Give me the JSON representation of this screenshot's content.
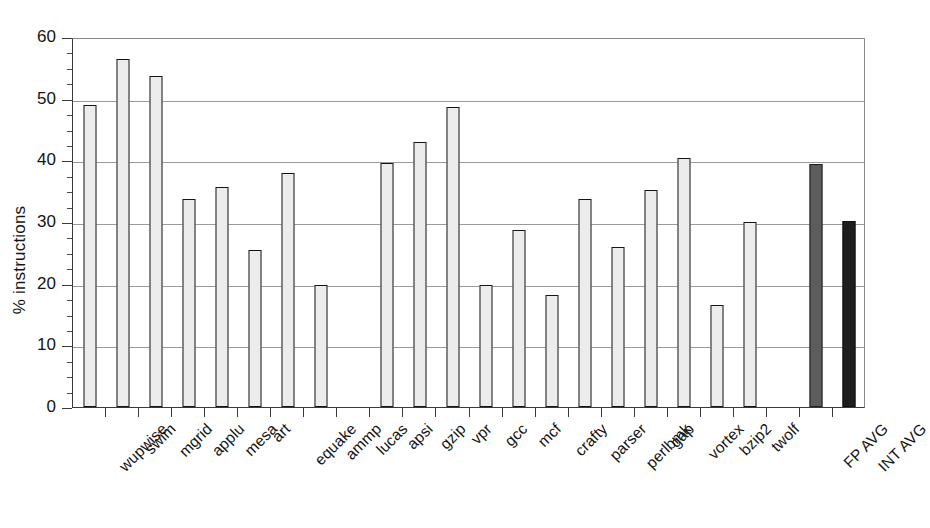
{
  "chart_data": {
    "type": "bar",
    "title": "",
    "xlabel": "",
    "ylabel": "% instructions",
    "ylim": [
      0,
      60
    ],
    "yticks": [
      0,
      10,
      20,
      30,
      40,
      50,
      60
    ],
    "ytick_labels": [
      "0",
      "10",
      "20",
      "30",
      "40",
      "50",
      "60"
    ],
    "minor_tick_step": 2.5,
    "grid": "horizontal",
    "legend": "none",
    "categories": [
      "wupwise",
      "swim",
      "mgrid",
      "applu",
      "mesa",
      "art",
      "equake",
      "ammp",
      "lucas",
      "apsi",
      "gzip",
      "vpr",
      "gcc",
      "mcf",
      "crafty",
      "parser",
      "perlbmk",
      "gap",
      "vortex",
      "bzip2",
      "twolf",
      "",
      "FP AVG",
      "INT AVG"
    ],
    "values": [
      49.0,
      56.4,
      53.6,
      33.7,
      35.6,
      25.4,
      38.0,
      19.8,
      null,
      39.6,
      43.0,
      48.6,
      19.8,
      28.7,
      18.1,
      33.7,
      26.0,
      35.2,
      40.4,
      16.5,
      30.0,
      null,
      39.4,
      30.1
    ],
    "bar_colors": [
      "#ececec",
      "#ececec",
      "#ececec",
      "#ececec",
      "#ececec",
      "#ececec",
      "#ececec",
      "#ececec",
      null,
      "#ececec",
      "#ececec",
      "#ececec",
      "#ececec",
      "#ececec",
      "#ececec",
      "#ececec",
      "#ececec",
      "#ececec",
      "#ececec",
      "#ececec",
      "#ececec",
      null,
      "#5c5c5c",
      "#1e1e1e"
    ],
    "series": [
      {
        "name": "% instructions",
        "values": [
          49.0,
          56.4,
          53.6,
          33.7,
          35.6,
          25.4,
          38.0,
          19.8,
          null,
          39.6,
          43.0,
          48.6,
          19.8,
          28.7,
          18.1,
          33.7,
          26.0,
          35.2,
          40.4,
          16.5,
          30.0,
          null,
          39.4,
          30.1
        ]
      }
    ],
    "notes": {
      "fp_avg_color": "#5c5c5c",
      "int_avg_color": "#1e1e1e",
      "benchmark_bar_color": "#ececec",
      "outline_color": "#141414"
    }
  }
}
